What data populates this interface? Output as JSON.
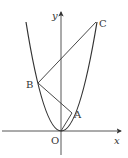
{
  "figure": {
    "axes": {
      "x_label": "x",
      "y_label": "y",
      "origin_label": "O"
    },
    "points": {
      "A": "A",
      "B": "B",
      "C": "C"
    },
    "colors": {
      "stroke": "#333333",
      "background": "#ffffff"
    }
  }
}
